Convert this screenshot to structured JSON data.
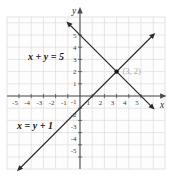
{
  "figure": {
    "background": "#ffffff",
    "plot_background": "#fdfdfd"
  },
  "chart_data": {
    "type": "line",
    "title": "",
    "xlabel": "x",
    "ylabel": "y",
    "xlim": [
      -6,
      7
    ],
    "ylim": [
      -6,
      6.5
    ],
    "grid": true,
    "legend": "none",
    "x_ticks": [
      -5,
      -4,
      -3,
      -2,
      -1,
      1,
      2,
      3,
      4,
      5
    ],
    "y_ticks": [
      -5,
      -4,
      -3,
      -2,
      -1,
      1,
      2,
      3,
      4,
      5
    ],
    "series": [
      {
        "name": "x + y = 5",
        "label": "x + y = 5",
        "points": [
          [
            0,
            5
          ],
          [
            5,
            0
          ],
          [
            3,
            2
          ]
        ],
        "arrow_ends": [
          [
            -0.85,
            5.85
          ],
          [
            5.85,
            -0.85
          ]
        ]
      },
      {
        "name": "x = y + 1",
        "label": "x = y + 1",
        "points": [
          [
            0,
            -1
          ],
          [
            1,
            0
          ],
          [
            3,
            2
          ]
        ],
        "arrow_ends": [
          [
            5.9,
            4.9
          ],
          [
            -4.9,
            -5.9
          ]
        ]
      }
    ],
    "intersection_point": {
      "x": 3,
      "y": 2,
      "label": "(3, 2)"
    },
    "colors": {
      "axis": "#4d4d4d",
      "line": "#2b2b2b",
      "grid": "#dcdcdc",
      "tick_text": "#3a3a3a",
      "equation_text": "#141414",
      "point": "#161616",
      "point_label": "#ababab",
      "plot_background": "#fdfdfd"
    }
  }
}
